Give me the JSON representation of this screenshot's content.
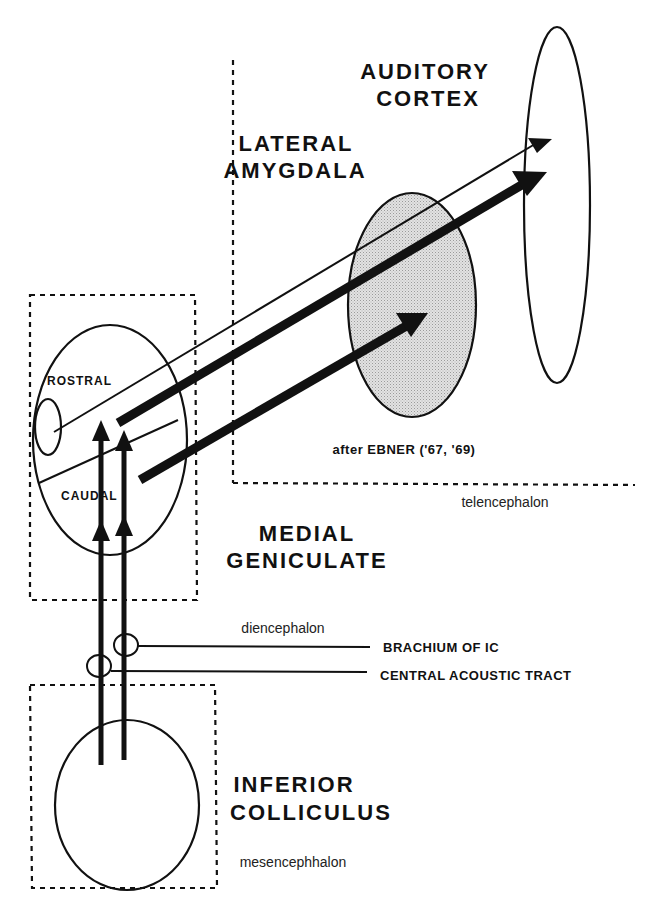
{
  "diagram": {
    "colors": {
      "ink": "#111111",
      "amygdala_fill": "#d9d9d9",
      "background": "#ffffff"
    },
    "regions": {
      "auditory_cortex": {
        "line1": "AUDITORY",
        "line2": "CORTEX"
      },
      "lateral_amygdala": {
        "line1": "LATERAL",
        "line2": "AMYGDALA"
      },
      "medial_geniculate": {
        "line1": "MEDIAL",
        "line2": "GENICULATE"
      },
      "inferior_colliculus": {
        "line1": "INFERIOR",
        "line2": "COLLICULUS"
      }
    },
    "subdivisions": {
      "rostral": "ROSTRAL",
      "caudal": "CAUDAL"
    },
    "brain_divisions": {
      "telencephalon": "telencephalon",
      "diencephalon": "diencephalon",
      "mesencephalon": "mesencephhalon"
    },
    "tracts": {
      "brachium": "BRACHIUM OF IC",
      "central_acoustic": "CENTRAL ACOUSTIC TRACT"
    },
    "citation": "after EBNER ('67, '69)"
  }
}
